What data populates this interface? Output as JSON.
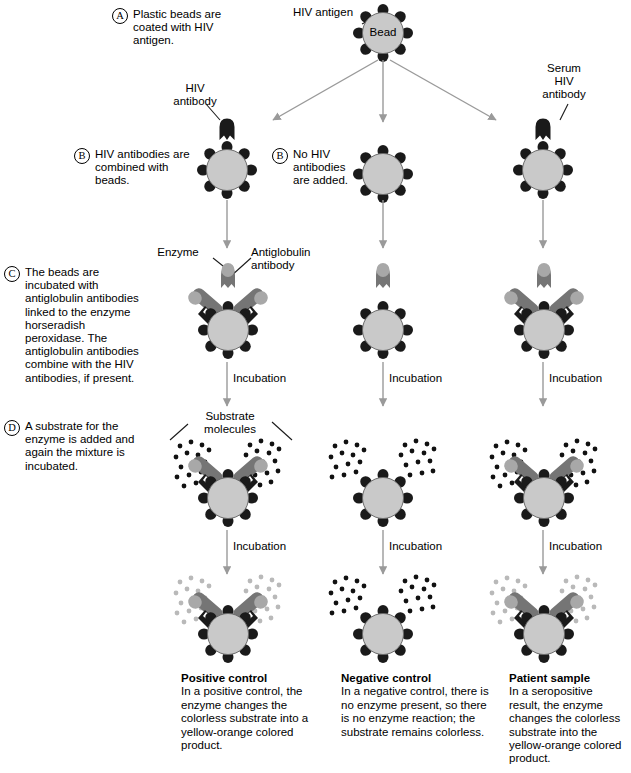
{
  "diagram": {
    "colors": {
      "bead_fill": "#c9c9c9",
      "bead_stroke": "#555555",
      "antigen_spike": "#1a1a1a",
      "hiv_antibody": "#1a1a1a",
      "antiglobulin_antibody": "#757575",
      "enzyme": "#a8a8a8",
      "substrate_dark": "#111111",
      "substrate_light": "#b9b9b9",
      "arrow": "#9a9a9a"
    }
  },
  "steps": {
    "a": {
      "letter": "A",
      "text": "Plastic beads are coated with HIV antigen."
    },
    "b": {
      "letter": "B",
      "text": "HIV antibodies are combined with beads."
    },
    "b2": {
      "letter": "B",
      "text": "No HIV antibodies are added."
    },
    "c": {
      "letter": "C",
      "text": "The beads are incubated with antiglobulin antibodies linked to the enzyme horseradish peroxidase. The antiglobulin antibodies combine with the HIV antibodies, if present."
    },
    "d": {
      "letter": "D",
      "text": "A substrate for the enzyme is added and again the mixture is incubated."
    }
  },
  "labels": {
    "hiv_antigen": "HIV antigen",
    "bead": "Bead",
    "hiv_antibody": "HIV\nantibody",
    "hiv_antibody_l1": "HIV",
    "hiv_antibody_l2": "antibody",
    "serum_l1": "Serum",
    "serum_l2": "HIV",
    "serum_l3": "antibody",
    "enzyme": "Enzyme",
    "antiglobulin_l1": "Antiglobulin",
    "antiglobulin_l2": "antibody",
    "substrate_l1": "Substrate",
    "substrate_l2": "molecules",
    "incubation": "Incubation"
  },
  "results": {
    "positive": {
      "title": "Positive control",
      "body": "In a positive control, the enzyme changes the colorless substrate into a yellow-orange colored product."
    },
    "negative": {
      "title": "Negative control",
      "body": "In a negative control, there is no enzyme present, so there is no enzyme reaction; the substrate remains colorless."
    },
    "patient": {
      "title": "Patient sample",
      "body": "In a seropositive result, the enzyme changes the colorless substrate into the yellow-orange colored product."
    }
  }
}
